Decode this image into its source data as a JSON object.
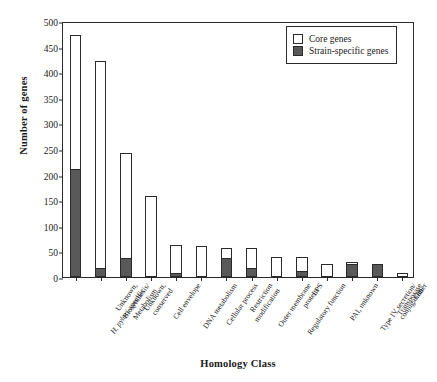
{
  "chart_data": {
    "type": "bar",
    "subtype": "stacked-vertical",
    "title": "",
    "xlabel": "Homology Class",
    "ylabel": "Number of genes",
    "ylim": [
      0,
      500
    ],
    "ytick_step": 50,
    "yticks": [
      "500",
      "450",
      "400",
      "350",
      "300",
      "250",
      "200",
      "150",
      "100",
      "50",
      "0"
    ],
    "grid": false,
    "legend_position": "top-right",
    "categories": [
      "Unknown, H. pylori-specific",
      "Biosynthesis/ Metabolism",
      "Unknown, conserved",
      "Cell envelope",
      "DNA metabolism",
      "Cellular process",
      "Restriction modification",
      "Outer membrane protein",
      "Regulatory function",
      "LPS",
      "PAI, unknown",
      "Type IV secretion/ conjugation",
      "Transposase",
      "Other"
    ],
    "category_lines": [
      [
        "Unknown,",
        "H. pylori-specific"
      ],
      [
        "Biosynthesis/",
        "Metabolism"
      ],
      [
        "Unknown,",
        "conserved"
      ],
      [
        "Cell envelope"
      ],
      [
        "DNA metabolism"
      ],
      [
        "Cellular process"
      ],
      [
        "Restriction",
        "modification"
      ],
      [
        "Outer membrane",
        "protein"
      ],
      [
        "Regulatory function"
      ],
      [
        "LPS"
      ],
      [
        "PAI, unknown"
      ],
      [
        "Type IV secretion/",
        "conjugation"
      ],
      [
        "Transposase"
      ],
      [
        "Other"
      ]
    ],
    "series": [
      {
        "name": "Strain-specific genes",
        "color": "#595959",
        "values": [
          210,
          18,
          37,
          0,
          7,
          0,
          38,
          17,
          0,
          11,
          0,
          25,
          26,
          0
        ]
      },
      {
        "name": "Core genes",
        "color": "#ffffff",
        "values": [
          263,
          403,
          206,
          159,
          56,
          60,
          19,
          40,
          40,
          28,
          26,
          4,
          0,
          8
        ]
      }
    ],
    "totals": [
      473,
      421,
      243,
      159,
      63,
      60,
      57,
      57,
      40,
      39,
      26,
      29,
      26,
      8
    ]
  },
  "legend": {
    "items": [
      {
        "label": "Core genes",
        "swatch": "core"
      },
      {
        "label": "Strain-specific genes",
        "swatch": "strain"
      }
    ]
  }
}
